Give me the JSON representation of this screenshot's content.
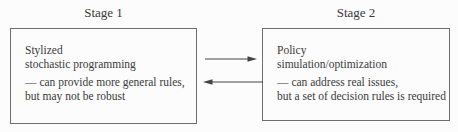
{
  "colors": {
    "background": "#fcfcfc",
    "text": "#3a3a3a",
    "box_border": "#6e6e6e",
    "arrow": "#444444"
  },
  "stage1": {
    "title": "Stage 1",
    "box": {
      "line1": "Stylized",
      "line2": "stochastic programming",
      "note1": "— can provide more general rules,",
      "note2": "but may not be robust"
    }
  },
  "stage2": {
    "title": "Stage 2",
    "box": {
      "line1": "Policy",
      "line2": "simulation/optimization",
      "note1": "— can address real issues,",
      "note2": "but a set of decision rules is required"
    }
  },
  "arrows": {
    "top_direction": "right",
    "bottom_direction": "left"
  }
}
